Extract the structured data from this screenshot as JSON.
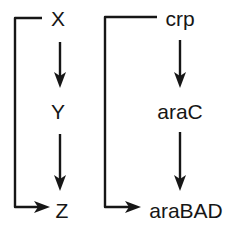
{
  "figure": {
    "background_color": "#ffffff",
    "ink_color": "#161616",
    "width": 232,
    "height": 237
  },
  "panels": [
    {
      "id": "abstract-ffl",
      "name": "abstract-feed-forward-loop",
      "nodes": [
        {
          "id": "x",
          "label": "X",
          "x": 58,
          "y": 18
        },
        {
          "id": "y",
          "label": "Y",
          "x": 58,
          "y": 111
        },
        {
          "id": "z",
          "label": "Z",
          "x": 62,
          "y": 210
        }
      ],
      "edges": [
        {
          "id": "x-to-y",
          "from": "X",
          "to": "Y",
          "kind": "direct-vertical-arrow"
        },
        {
          "id": "y-to-z",
          "from": "Y",
          "to": "Z",
          "kind": "direct-vertical-arrow"
        },
        {
          "id": "x-to-z",
          "from": "X",
          "to": "Z",
          "kind": "bypass-bracket-arrow"
        }
      ]
    },
    {
      "id": "arabinose-ffl",
      "name": "arabinose-system-feed-forward-loop",
      "nodes": [
        {
          "id": "crp",
          "label": "crp",
          "x": 180,
          "y": 18
        },
        {
          "id": "arac",
          "label": "araC",
          "x": 180,
          "y": 111
        },
        {
          "id": "arabad",
          "label": "araBAD",
          "x": 186,
          "y": 210
        }
      ],
      "edges": [
        {
          "id": "crp-to-arac",
          "from": "crp",
          "to": "araC",
          "kind": "direct-vertical-arrow"
        },
        {
          "id": "arac-to-arabad",
          "from": "araC",
          "to": "araBAD",
          "kind": "direct-vertical-arrow"
        },
        {
          "id": "crp-to-arabad",
          "from": "crp",
          "to": "araBAD",
          "kind": "bypass-bracket-arrow"
        }
      ]
    }
  ],
  "labels": {
    "x": "X",
    "y": "Y",
    "z": "Z",
    "crp": "crp",
    "arac": "araC",
    "arabad": "araBAD"
  }
}
